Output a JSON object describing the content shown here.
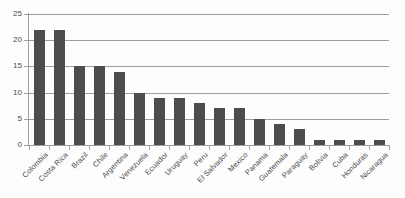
{
  "chart_data": {
    "type": "bar",
    "title": "",
    "subtitle": "",
    "xlabel": "",
    "ylabel": "",
    "ylim": [
      0,
      25
    ],
    "ytick_labels": [
      "25",
      "20",
      "15",
      "10",
      "5",
      "0"
    ],
    "ytick_values": [
      25,
      20,
      15,
      10,
      5,
      0
    ],
    "grid": "horizontal",
    "legend": "none",
    "bar_color": "#4d4d4d",
    "gridline_color": "#9d9d9d",
    "axis_color": "#9d9d9d",
    "background_color": "#fdfdfd",
    "label_color": "#4a4a4a",
    "categories": [
      "Colombia",
      "Costa Rica",
      "Brazil",
      "Chile",
      "Argentina",
      "Venezuela",
      "Ecuador",
      "Uruguay",
      "Peru",
      "El Salvador",
      "Mexico",
      "Panama",
      "Guatemala",
      "Paraguay",
      "Bolivia",
      "Cuba",
      "Honduras",
      "Nicaragua"
    ],
    "values": [
      22,
      22,
      15,
      15,
      14,
      10,
      9,
      9,
      8,
      7,
      7,
      5,
      4,
      3,
      1,
      1,
      1,
      1
    ]
  }
}
